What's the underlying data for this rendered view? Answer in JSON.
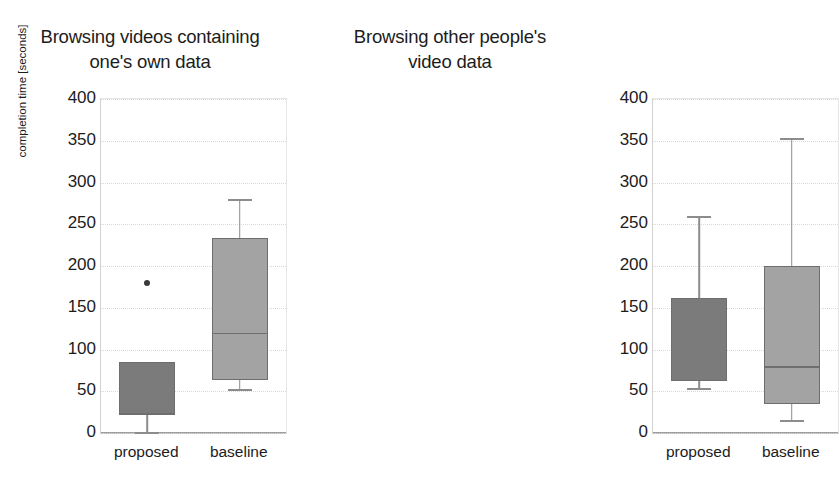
{
  "figure": {
    "y_axis_label": "completion time [seconds]",
    "tick_labels": [
      "400",
      "350",
      "300",
      "250",
      "200",
      "150",
      "100",
      "50",
      "0"
    ],
    "tick_values": [
      400,
      350,
      300,
      250,
      200,
      150,
      100,
      50,
      0
    ],
    "category_labels": [
      "proposed",
      "baseline"
    ],
    "colors": {
      "proposed_fill": "#7b7b7b",
      "baseline_fill": "#a3a3a3",
      "box_border": "#6e6e6e",
      "whisker": "#8c8c8c",
      "gridline": "#d8d8d8",
      "outlier": "#3a3a3a",
      "text": "#1c1c1c",
      "background": "#ffffff"
    }
  },
  "panels": [
    {
      "title_line1": "Browsing videos containing",
      "title_line2": "one's own data",
      "x_label_1": "proposed",
      "x_label_2": "baseline"
    },
    {
      "title_line1": "Browsing other people's",
      "title_line2": "video data",
      "x_label_1": "proposed",
      "x_label_2": "baseline"
    }
  ],
  "chart_data": [
    {
      "type": "box",
      "title": "Browsing videos containing one's own data",
      "xlabel": "",
      "ylabel": "completion time [seconds]",
      "ylim": [
        0,
        400
      ],
      "yticks": [
        0,
        50,
        100,
        150,
        200,
        250,
        300,
        350,
        400
      ],
      "grid": true,
      "legend": "none",
      "categories": [
        "proposed",
        "baseline"
      ],
      "boxes": [
        {
          "name": "proposed",
          "whisker_low": 1,
          "q1": 22,
          "median": 24,
          "q3": 85,
          "whisker_high": 85,
          "outliers": [
            180
          ],
          "fill": "#7b7b7b"
        },
        {
          "name": "baseline",
          "whisker_low": 53,
          "q1": 63,
          "median": 120,
          "q3": 233,
          "whisker_high": 280,
          "outliers": [],
          "fill": "#a3a3a3"
        }
      ]
    },
    {
      "type": "box",
      "title": "Browsing other people's video data",
      "xlabel": "",
      "ylabel": "completion time [seconds]",
      "ylim": [
        0,
        400
      ],
      "yticks": [
        0,
        50,
        100,
        150,
        200,
        250,
        300,
        350,
        400
      ],
      "grid": true,
      "legend": "none",
      "categories": [
        "proposed",
        "baseline"
      ],
      "boxes": [
        {
          "name": "proposed",
          "whisker_low": 54,
          "q1": 62,
          "median": 64,
          "q3": 162,
          "whisker_high": 260,
          "outliers": [],
          "fill": "#7b7b7b"
        },
        {
          "name": "baseline",
          "whisker_low": 15,
          "q1": 35,
          "median": 80,
          "q3": 200,
          "whisker_high": 353,
          "outliers": [],
          "fill": "#a3a3a3"
        }
      ]
    }
  ]
}
